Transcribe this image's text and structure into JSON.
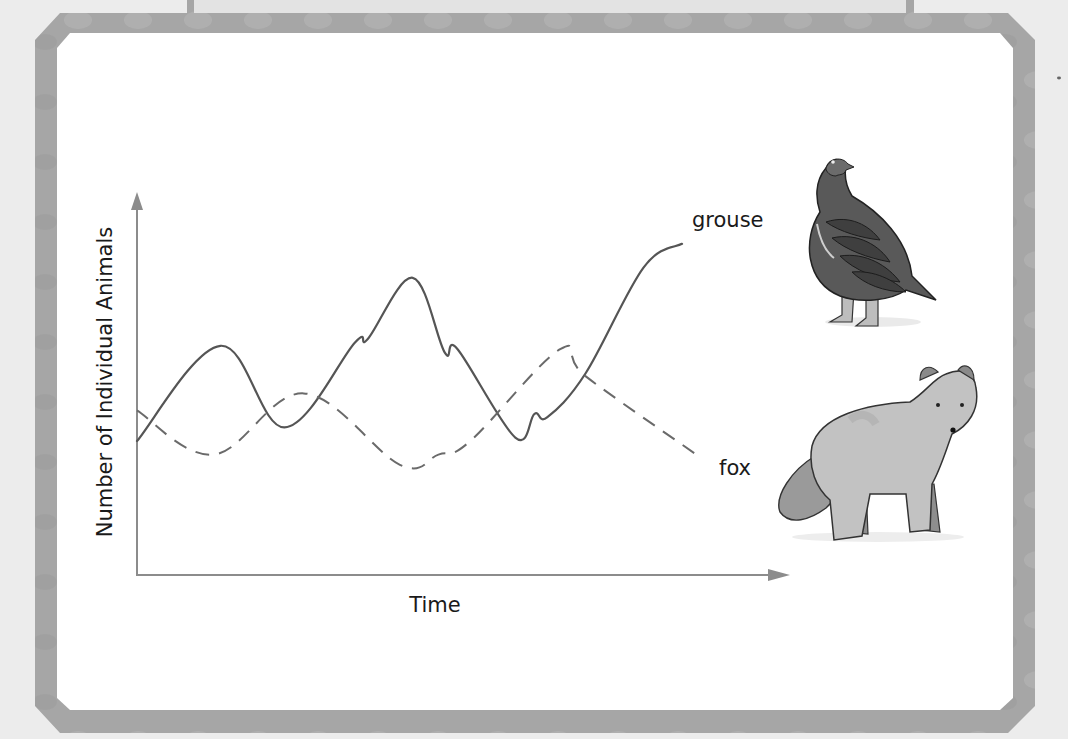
{
  "frame": {
    "background_color": "#ececec",
    "border_color": "#a9a9a9",
    "tab_color": "#e3e3e3",
    "panel_color": "#ffffff"
  },
  "chart_data": {
    "type": "line",
    "title": "",
    "xlabel": "Time",
    "ylabel": "Number of Individual Animals",
    "grid": false,
    "axis_ticks": false,
    "legend_position": "inline-right",
    "x_range": [
      0,
      100
    ],
    "y_range": [
      0,
      100
    ],
    "series": [
      {
        "name": "grouse",
        "style": "solid",
        "color": "#555555",
        "points": [
          [
            0,
            35
          ],
          [
            13,
            63
          ],
          [
            23,
            39
          ],
          [
            34,
            64
          ],
          [
            36,
            65
          ],
          [
            43,
            83
          ],
          [
            48,
            61
          ],
          [
            50,
            62
          ],
          [
            59,
            36
          ],
          [
            62,
            43
          ],
          [
            64,
            42
          ],
          [
            70,
            55
          ],
          [
            79,
            86
          ],
          [
            85,
            93
          ]
        ]
      },
      {
        "name": "fox",
        "style": "dashed",
        "color": "#6a6a6a",
        "points": [
          [
            0,
            44
          ],
          [
            12,
            31
          ],
          [
            26,
            49
          ],
          [
            41,
            28
          ],
          [
            47,
            31
          ],
          [
            52,
            35
          ],
          [
            66,
            62
          ],
          [
            70,
            54
          ],
          [
            88,
            30
          ]
        ]
      }
    ],
    "annotations": [
      {
        "text": "grouse",
        "attached_to": "grouse",
        "position": "end"
      },
      {
        "text": "fox",
        "attached_to": "fox",
        "position": "end"
      }
    ]
  },
  "labels": {
    "x_axis": "Time",
    "y_axis": "Number of Individual Animals",
    "grouse": "grouse",
    "fox": "fox"
  },
  "illustrations": {
    "grouse": "grouse-bird-illustration",
    "fox": "arctic-fox-illustration"
  }
}
